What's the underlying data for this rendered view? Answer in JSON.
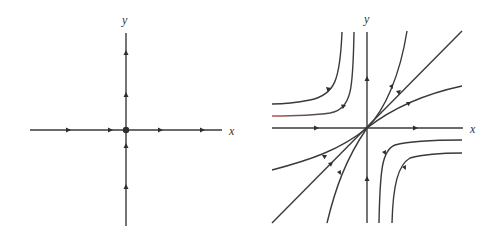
{
  "figure": {
    "line_color": "#3a3a3a",
    "accent_color": "#c0504d",
    "left_panel": {
      "x_label": "x",
      "y_label": "y",
      "origin_marker": "filled dot",
      "x_axis_arrows": [
        "right",
        "right",
        "right",
        "right"
      ],
      "y_axis_arrows_above": [
        "up",
        "up"
      ],
      "y_axis_arrows_below": [
        "up",
        "up"
      ]
    },
    "right_panel": {
      "x_label": "x",
      "y_label": "y",
      "trajectories": [
        "diagonal line through origin, arrows outward",
        "curves leaving origin in first quadrant",
        "curves approaching origin in third quadrant",
        "hyperbola-like curves in second and fourth quadrants"
      ]
    }
  }
}
